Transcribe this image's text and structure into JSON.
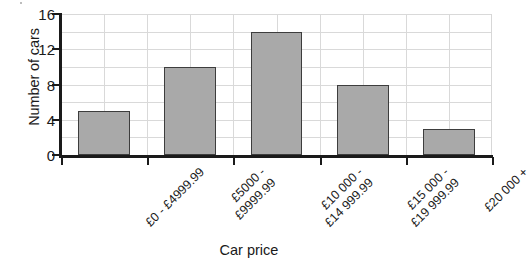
{
  "chart_data": {
    "type": "bar",
    "title": "",
    "xlabel": "Car price",
    "ylabel": "Number of cars",
    "categories": [
      "£0 - £4999.99",
      "£5000 -\n£9999.99",
      "£10 000 -\n£14 999.99",
      "£15 000 -\n£19 999.99",
      "£20 000 +"
    ],
    "values": [
      5,
      10,
      14,
      8,
      3
    ],
    "ylim": [
      0,
      16
    ],
    "y_ticks": [
      0,
      4,
      8,
      12,
      16
    ],
    "y_tick_labels": [
      "0",
      "4",
      "8",
      "12",
      "16"
    ],
    "gridline_interval": 2,
    "grid": true,
    "legend": "none",
    "bar_color": "#a9a9a9",
    "bar_border_color": "#3d3d3d",
    "gridline_color": "#d9d9d9",
    "axis_color": "#1a1a1a",
    "label_rotation_deg": 45
  },
  "axes": {
    "y_title": "Number of cars",
    "x_title": "Car price"
  }
}
